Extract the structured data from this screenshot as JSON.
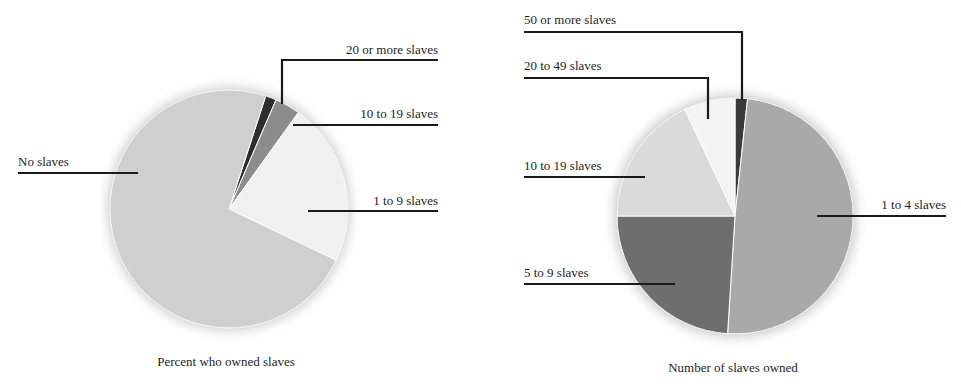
{
  "chart_data": [
    {
      "type": "pie",
      "title": "Percent who owned slaves",
      "categories": [
        "No slaves",
        "1 to 9 slaves",
        "10 to 19 slaves",
        "20 or more slaves"
      ],
      "values": [
        74.0,
        22.5,
        3.5,
        1.5
      ],
      "start_angle_deg": 18,
      "slices": [
        {
          "label": "20 or more slaves",
          "value": 1.5,
          "color": "#2e2e2e"
        },
        {
          "label": "10 to 19 slaves",
          "value": 3.5,
          "color": "#8c8c8c"
        },
        {
          "label": "1 to 9 slaves",
          "value": 22.5,
          "color": "#f0f0f0"
        },
        {
          "label": "No slaves",
          "value": 74.0,
          "color": "#cfcfcf"
        }
      ],
      "legend_position": "leader-lines"
    },
    {
      "type": "pie",
      "title": "Number of slaves owned",
      "categories": [
        "50 or more slaves",
        "1 to 4 slaves",
        "5 to 9 slaves",
        "10 to 19 slaves",
        "20 to 49 slaves"
      ],
      "values": [
        1.7,
        49.3,
        24.0,
        18.0,
        7.0
      ],
      "start_angle_deg": 0,
      "slices": [
        {
          "label": "50 or more slaves",
          "value": 1.7,
          "color": "#3a3a3a"
        },
        {
          "label": "1 to 4 slaves",
          "value": 49.3,
          "color": "#a9a9a9"
        },
        {
          "label": "5 to 9 slaves",
          "value": 24.0,
          "color": "#6e6e6e"
        },
        {
          "label": "10 to 19 slaves",
          "value": 18.0,
          "color": "#dadada"
        },
        {
          "label": "20 to 49 slaves",
          "value": 7.0,
          "color": "#f3f3f3"
        }
      ],
      "legend_position": "leader-lines"
    }
  ],
  "left_chart": {
    "caption": "Percent who owned slaves",
    "labels": {
      "twenty_plus": "20 or more slaves",
      "ten_nineteen": "10 to 19 slaves",
      "one_nine": "1 to 9 slaves",
      "none": "No slaves"
    }
  },
  "right_chart": {
    "caption": "Number of slaves owned",
    "labels": {
      "fifty_plus": "50 or more slaves",
      "twenty_fortynine": "20 to 49 slaves",
      "ten_nineteen": "10 to 19 slaves",
      "one_four": "1 to 4 slaves",
      "five_nine": "5 to 9 slaves"
    }
  }
}
